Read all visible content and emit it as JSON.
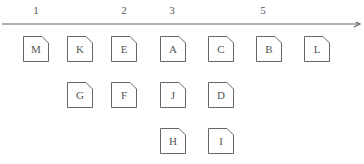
{
  "timeline": {
    "ticks": [
      {
        "label": "1",
        "x": 36
      },
      {
        "label": "2",
        "x": 124
      },
      {
        "label": "3",
        "x": 172
      },
      {
        "label": "5",
        "x": 263
      }
    ]
  },
  "nodes": [
    {
      "label": "M",
      "x": 23,
      "y": 36
    },
    {
      "label": "K",
      "x": 67,
      "y": 36
    },
    {
      "label": "E",
      "x": 111,
      "y": 36
    },
    {
      "label": "A",
      "x": 160,
      "y": 36
    },
    {
      "label": "C",
      "x": 208,
      "y": 36
    },
    {
      "label": "B",
      "x": 256,
      "y": 36
    },
    {
      "label": "L",
      "x": 304,
      "y": 36
    },
    {
      "label": "G",
      "x": 67,
      "y": 82
    },
    {
      "label": "F",
      "x": 111,
      "y": 82
    },
    {
      "label": "J",
      "x": 160,
      "y": 82
    },
    {
      "label": "D",
      "x": 208,
      "y": 82
    },
    {
      "label": "H",
      "x": 160,
      "y": 128
    },
    {
      "label": "I",
      "x": 208,
      "y": 128
    }
  ],
  "colors": {
    "stroke": "#666666",
    "text": "#555555"
  }
}
